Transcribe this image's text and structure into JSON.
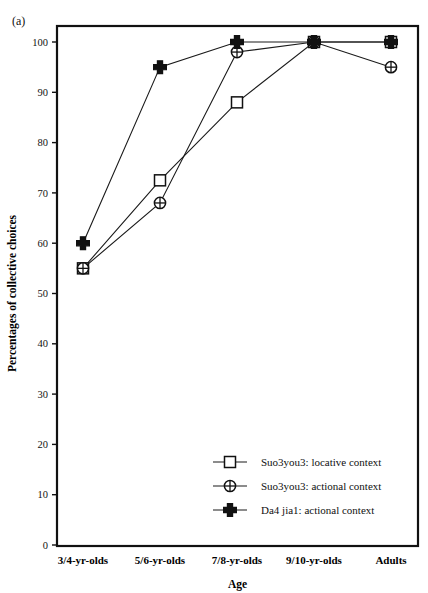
{
  "figure": {
    "running_head": "",
    "panel_label": "(a)"
  },
  "chart_data": {
    "type": "line",
    "title": "",
    "xlabel": "Age",
    "ylabel": "Percentages of collective choices",
    "categories": [
      "3/4-yr-olds",
      "5/6-yr-olds",
      "7/8-yr-olds",
      "9/10-yr-olds",
      "Adults"
    ],
    "ylim": [
      0,
      100
    ],
    "yticks": [
      0,
      10,
      20,
      30,
      40,
      50,
      60,
      70,
      80,
      90,
      100
    ],
    "ytick_labels": [
      "0",
      "10",
      "20",
      "30",
      "40",
      "50",
      "60",
      "70",
      "80",
      "90",
      "100"
    ],
    "grid": false,
    "legend_position": "inside-lower-right",
    "series": [
      {
        "name": "Suo3you3: locative context",
        "marker": "square",
        "values": [
          55,
          72.5,
          88,
          100,
          100
        ]
      },
      {
        "name": "Suo3you3: actional context",
        "marker": "circle-cross",
        "values": [
          55,
          68,
          98,
          100,
          95
        ]
      },
      {
        "name": "Da4 jia1: actional context",
        "marker": "plus-cross",
        "values": [
          60,
          95,
          100,
          100,
          100
        ]
      }
    ]
  }
}
